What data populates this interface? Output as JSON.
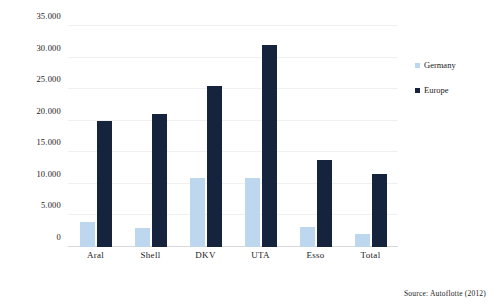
{
  "chart_data": {
    "type": "bar",
    "title": "",
    "subtitle": "",
    "xlabel": "",
    "ylabel": "",
    "categories": [
      "Aral",
      "Shell",
      "DKV",
      "UTA",
      "Esso",
      "Total"
    ],
    "series": [
      {
        "name": "Germany",
        "color": "#bdd7ee",
        "values": [
          4000,
          3000,
          11000,
          11000,
          3200,
          2000
        ]
      },
      {
        "name": "Europe",
        "color": "#16233c",
        "values": [
          20000,
          21000,
          25500,
          32000,
          13800,
          11600
        ]
      }
    ],
    "ylim": [
      0,
      35000
    ],
    "ytick_values": [
      0,
      5000,
      10000,
      15000,
      20000,
      25000,
      30000,
      35000
    ],
    "ytick_labels": [
      "0",
      "5.000",
      "10.000",
      "15.000",
      "20.000",
      "25.000",
      "30.000",
      "35.000"
    ],
    "grid": true,
    "legend_position": "right",
    "annotations": [
      "Source: Autoflotte (2012)"
    ]
  },
  "legend": {
    "items": [
      {
        "label": "Germany"
      },
      {
        "label": "Europe"
      }
    ]
  },
  "footer": {
    "source": "Source: Autoflotte (2012)"
  }
}
